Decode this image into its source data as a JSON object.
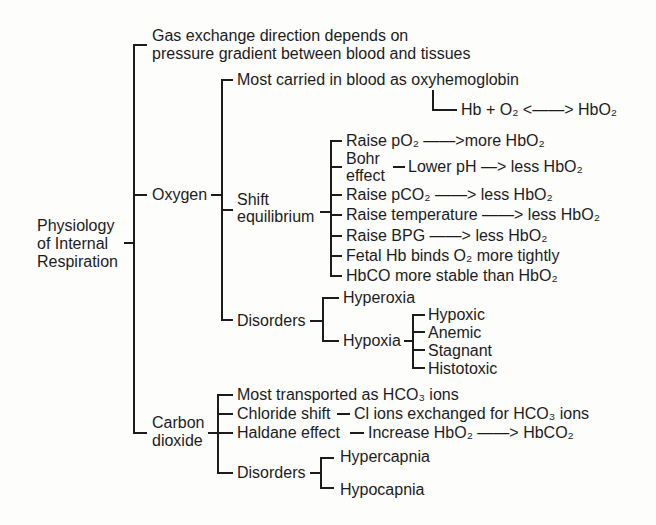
{
  "root": {
    "label_lines": [
      "Physiology",
      "of Internal",
      "Respiration"
    ]
  },
  "general": {
    "lines": [
      "Gas exchange direction depends on",
      "pressure gradient between blood and tissues"
    ]
  },
  "oxygen": {
    "label": "Oxygen",
    "transport": {
      "text": "Most carried in blood as oxyhemoglobin",
      "equation": "Hb + O₂ <——> HbO₂"
    },
    "shift_equilibrium": {
      "label_lines": [
        "Shift",
        "equilibrium"
      ],
      "items": [
        {
          "text": "Raise pO₂ ——>more HbO₂"
        },
        {
          "label_lines": [
            "Bohr",
            "effect"
          ],
          "detail": "Lower pH —> less HbO₂"
        },
        {
          "text": "Raise pCO₂ ——> less HbO₂"
        },
        {
          "text": "Raise temperature ——> less HbO₂"
        },
        {
          "text": "Raise BPG ——> less HbO₂"
        },
        {
          "text": "Fetal Hb binds O₂ more tightly"
        },
        {
          "text": "HbCO more stable than HbO₂"
        }
      ]
    },
    "disorders": {
      "label": "Disorders",
      "hyperoxia": "Hyperoxia",
      "hypoxia": {
        "label": "Hypoxia",
        "types": [
          "Hypoxic",
          "Anemic",
          "Stagnant",
          "Histotoxic"
        ]
      }
    }
  },
  "carbon_dioxide": {
    "label_lines": [
      "Carbon",
      "dioxide"
    ],
    "transport": "Most transported as HCO₃ ions",
    "chloride_shift": {
      "label": "Chloride shift",
      "detail": "Cl ions exchanged for HCO₃ ions"
    },
    "haldane_effect": {
      "label": "Haldane effect",
      "detail": "Increase HbO₂ ——> HbCO₂"
    },
    "disorders": {
      "label": "Disorders",
      "items": [
        "Hypercapnia",
        "Hypocapnia"
      ]
    }
  },
  "colors": {
    "ink": "#1c1c1c",
    "background": "#fdfdfc"
  }
}
